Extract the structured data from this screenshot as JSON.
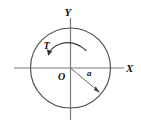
{
  "figure": {
    "background_color": "#ffffff",
    "stroke_color": "#3f3f3f",
    "axis_color": "#6b6b6b",
    "label_color": "#111111",
    "axes": {
      "x_label": "X",
      "y_label": "Y",
      "origin_label": "O"
    },
    "circle": {
      "center_x": 70.5,
      "center_y": 68,
      "radius": 40
    },
    "radius_vector": {
      "label": "a",
      "from_x": 70.5,
      "from_y": 68,
      "to_x": 99.5,
      "to_y": 92.5,
      "label_x": 88,
      "label_y": 73
    },
    "torque_arrow": {
      "label": "T",
      "direction": "counterclockwise",
      "label_x": 46,
      "label_y": 47,
      "arc_start_x": 85,
      "arc_start_y": 49,
      "arc_end_x": 49,
      "arc_end_y": 52
    }
  }
}
